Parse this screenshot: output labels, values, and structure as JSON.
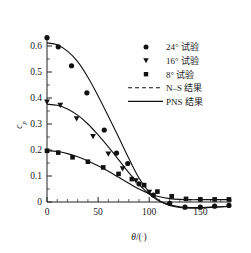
{
  "chart_data": {
    "type": "scatter",
    "title": "",
    "xlabel": "θ/(°)",
    "ylabel": "c_p",
    "xlim": [
      0,
      180
    ],
    "ylim": [
      -0.05,
      0.65
    ],
    "xticks": [
      0,
      50,
      100,
      150
    ],
    "xtick_labels": [
      "0",
      "50",
      "100",
      "150"
    ],
    "yticks": [
      0,
      0.1,
      0.2,
      0.3,
      0.4,
      0.5,
      0.6
    ],
    "ytick_labels": [
      "0",
      "0.1",
      "0.2",
      "0.3",
      "0.4",
      "0.5",
      "0.6"
    ],
    "grid": false,
    "legend_position": "upper right",
    "series": [
      {
        "name": "24° 试验",
        "marker": "circle",
        "style": "points",
        "x": [
          0,
          11,
          24,
          39,
          56,
          68,
          79,
          90,
          104,
          120,
          135,
          150,
          164,
          178
        ],
        "y": [
          0.632,
          0.597,
          0.524,
          0.42,
          0.277,
          0.188,
          0.148,
          0.07,
          0.027,
          -0.005,
          -0.02,
          -0.02,
          -0.016,
          -0.013
        ]
      },
      {
        "name": "16° 试验",
        "marker": "triangle-down",
        "style": "points",
        "x": [
          0,
          13,
          29,
          45,
          60,
          74,
          87,
          100
        ],
        "y": [
          0.385,
          0.372,
          0.32,
          0.252,
          0.185,
          0.128,
          0.082,
          0.038
        ]
      },
      {
        "name": "8° 试验",
        "marker": "square",
        "style": "points",
        "x": [
          0,
          11,
          25,
          40,
          55,
          70,
          83,
          95,
          108,
          122,
          136,
          150,
          164,
          178
        ],
        "y": [
          0.197,
          0.19,
          0.172,
          0.155,
          0.133,
          0.108,
          0.088,
          0.065,
          0.04,
          0.022,
          0.012,
          0.01,
          0.01,
          0.01
        ]
      },
      {
        "name": "N–S 结果",
        "marker": "none",
        "style": "dashed-line"
      },
      {
        "name": "PNS 结果",
        "marker": "none",
        "style": "solid-line"
      }
    ],
    "curves": [
      {
        "name": "PNS 24°",
        "x": [
          0,
          10,
          20,
          30,
          40,
          50,
          60,
          70,
          80,
          90,
          100,
          110,
          120,
          130,
          140,
          150,
          160,
          170,
          180
        ],
        "y": [
          0.612,
          0.605,
          0.58,
          0.54,
          0.48,
          0.408,
          0.33,
          0.25,
          0.168,
          0.092,
          0.038,
          0.005,
          -0.013,
          -0.021,
          -0.024,
          -0.023,
          -0.021,
          -0.019,
          -0.017
        ]
      },
      {
        "name": "PNS 16°",
        "x": [
          0,
          10,
          20,
          30,
          40,
          50,
          60,
          70,
          80,
          90,
          100,
          110,
          120,
          130,
          140,
          150,
          160,
          170,
          180
        ],
        "y": [
          0.376,
          0.372,
          0.358,
          0.334,
          0.3,
          0.258,
          0.212,
          0.163,
          0.113,
          0.068,
          0.03,
          0.003,
          -0.011,
          -0.018,
          -0.021,
          -0.021,
          -0.019,
          -0.018,
          -0.016
        ]
      },
      {
        "name": "PNS 8°",
        "x": [
          0,
          10,
          20,
          30,
          40,
          50,
          60,
          70,
          80,
          90,
          100,
          110,
          120,
          130,
          140,
          150,
          160,
          170,
          180
        ],
        "y": [
          0.197,
          0.194,
          0.186,
          0.174,
          0.158,
          0.139,
          0.118,
          0.095,
          0.072,
          0.05,
          0.032,
          0.02,
          0.013,
          0.01,
          0.009,
          0.009,
          0.009,
          0.009,
          0.009
        ]
      }
    ]
  },
  "axes": {
    "x_title": "θ/(°)",
    "y_title": "c",
    "y_title_sub": "p",
    "x_tick_0": "0",
    "x_tick_1": "50",
    "x_tick_2": "100",
    "x_tick_3": "150",
    "y_tick_0": "0",
    "y_tick_1": "0.1",
    "y_tick_2": "0.2",
    "y_tick_3": "0.3",
    "y_tick_4": "0.4",
    "y_tick_5": "0.5",
    "y_tick_6": "0.6"
  },
  "legend": {
    "items": [
      {
        "label": "24° 试验",
        "marker": "circle-icon"
      },
      {
        "label": "16° 试验",
        "marker": "triangle-down-icon"
      },
      {
        "label": "8° 试验",
        "marker": "square-icon"
      },
      {
        "label": "N–S 结果",
        "marker": "dashed-line-icon"
      },
      {
        "label": "PNS 结果",
        "marker": "solid-line-icon"
      }
    ]
  },
  "colors": {
    "ink": "#111111",
    "background": "#fefefe"
  }
}
